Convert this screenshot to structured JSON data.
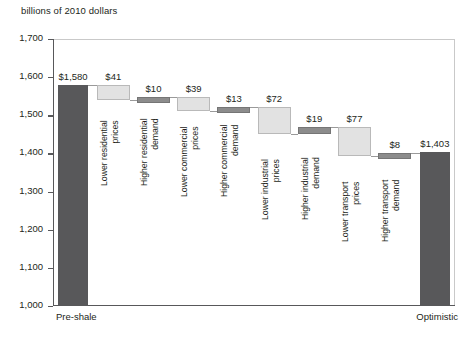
{
  "chart_data": {
    "type": "bar",
    "subtype": "waterfall",
    "title": "",
    "xlabel": "",
    "ylabel": "billions of 2010 dollars",
    "ylim": [
      1000,
      1700
    ],
    "ytick_values": [
      1000,
      1100,
      1200,
      1300,
      1400,
      1500,
      1600,
      1700
    ],
    "ytick_labels": [
      "1,000",
      "1,100",
      "1,200",
      "1,300",
      "1,400",
      "1,500",
      "1,600",
      "1,700"
    ],
    "grid": false,
    "legend": null,
    "categories": [
      "Pre-shale",
      "Lower residential prices",
      "Higher residential demand",
      "Lower commercial prices",
      "Higher commercial demand",
      "Lower industrial prices",
      "Higher industrial demand",
      "Lower transport prices",
      "Higher transport demand",
      "Optimistic"
    ],
    "steps": [
      {
        "label": "Pre-shale",
        "kind": "total",
        "value": 1580,
        "display": "$1,580",
        "start": 1000,
        "end": 1580
      },
      {
        "label": "Lower residential prices",
        "kind": "decrease",
        "value": -41,
        "display": "$41",
        "start": 1580,
        "end": 1539
      },
      {
        "label": "Higher residential demand",
        "kind": "increase",
        "value": 10,
        "display": "$10",
        "start": 1539,
        "end": 1549
      },
      {
        "label": "Lower commercial prices",
        "kind": "decrease",
        "value": -39,
        "display": "$39",
        "start": 1549,
        "end": 1510
      },
      {
        "label": "Higher commercial demand",
        "kind": "increase",
        "value": 13,
        "display": "$13",
        "start": 1510,
        "end": 1523
      },
      {
        "label": "Lower industrial prices",
        "kind": "decrease",
        "value": -72,
        "display": "$72",
        "start": 1523,
        "end": 1451
      },
      {
        "label": "Higher industrial demand",
        "kind": "increase",
        "value": 19,
        "display": "$19",
        "start": 1451,
        "end": 1470
      },
      {
        "label": "Lower transport prices",
        "kind": "decrease",
        "value": -77,
        "display": "$77",
        "start": 1470,
        "end": 1393
      },
      {
        "label": "Higher transport demand",
        "kind": "increase",
        "value": 8,
        "display": "$8",
        "start": 1393,
        "end": 1401
      },
      {
        "label": "Optimistic",
        "kind": "total",
        "value": 1403,
        "display": "$1,403",
        "start": 1000,
        "end": 1403
      }
    ],
    "colors": {
      "total_bar": "#58585a",
      "decrease_bar": "#e2e2e2",
      "increase_bar": "#8c8c8c",
      "axis": "#58585a",
      "text": "#231f20"
    }
  },
  "axis": {
    "unit_label": "billions of 2010 dollars",
    "x_start_label": "Pre-shale",
    "x_end_label": "Optimistic"
  }
}
